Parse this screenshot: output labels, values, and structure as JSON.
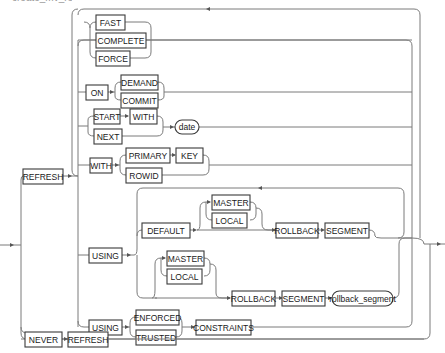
{
  "header_fragment": "create_mv_refresh",
  "diagram": {
    "type": "railroad-syntax",
    "keywords": {
      "refresh": "REFRESH",
      "fast": "FAST",
      "complete": "COMPLETE",
      "force": "FORCE",
      "on": "ON",
      "demand": "DEMAND",
      "commit": "COMMIT",
      "start": "START",
      "with1": "WITH",
      "next": "NEXT",
      "date": "date",
      "with2": "WITH",
      "primary": "PRIMARY",
      "key": "KEY",
      "rowid": "ROWID",
      "using1": "USING",
      "default": "DEFAULT",
      "master1": "MASTER",
      "local1": "LOCAL",
      "rollback1": "ROLLBACK",
      "segment1": "SEGMENT",
      "master2": "MASTER",
      "local2": "LOCAL",
      "rollback2": "ROLLBACK",
      "segment2": "SEGMENT",
      "rollback_segment": "rollback_segment",
      "using2": "USING",
      "enforced": "ENFORCED",
      "trusted": "TRUSTED",
      "constraints": "CONSTRAINTS",
      "never": "NEVER",
      "refresh2": "REFRESH"
    }
  }
}
